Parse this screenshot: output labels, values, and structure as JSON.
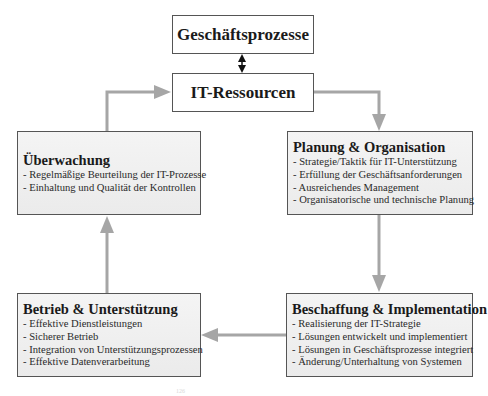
{
  "diagram": {
    "top_box": {
      "label": "Geschäftsprozesse"
    },
    "center_box": {
      "label": "IT-Ressourcen"
    },
    "processes": [
      {
        "id": "planung",
        "title": "Planung & Organisation",
        "items": [
          "- Strategie/Taktik für IT-Unterstützung",
          "- Erfüllung der Geschäftsanforderungen",
          "- Ausreichendes Management",
          "- Organisatorische und technische Planung"
        ]
      },
      {
        "id": "beschaffung",
        "title": "Beschaffung & Implementation",
        "items": [
          "- Realisierung der IT-Strategie",
          "- Lösungen entwickelt und implementiert",
          "- Lösungen in Geschäftsprozesse integriert",
          "- Änderung/Unterhaltung von Systemen"
        ]
      },
      {
        "id": "betrieb",
        "title": "Betrieb & Unterstützung",
        "items": [
          "- Effektive Dienstleistungen",
          "- Sicherer Betrieb",
          "- Integration von Unterstützungsprozessen",
          "- Effektive Datenverarbeitung"
        ]
      },
      {
        "id": "ueberwachung",
        "title": "Überwachung",
        "items": [
          "- Regelmäßige Beurteilung der IT-Prozesse",
          "- Einhaltung und Qualität der Kontrollen"
        ]
      }
    ],
    "connections": [
      {
        "from": "Geschäftsprozesse",
        "to": "IT-Ressourcen",
        "type": "bidirectional"
      },
      {
        "from": "IT-Ressourcen",
        "to": "Planung & Organisation",
        "type": "arrow"
      },
      {
        "from": "Planung & Organisation",
        "to": "Beschaffung & Implementation",
        "type": "arrow"
      },
      {
        "from": "Beschaffung & Implementation",
        "to": "Betrieb & Unterstützung",
        "type": "arrow"
      },
      {
        "from": "Betrieb & Unterstützung",
        "to": "Überwachung",
        "type": "arrow"
      },
      {
        "from": "Überwachung",
        "to": "IT-Ressourcen",
        "type": "arrow"
      }
    ],
    "colors": {
      "arrow_gray": "#a6a6a6",
      "arrow_black": "#111111",
      "box_border": "#555555"
    },
    "footnote_mark": "126"
  }
}
